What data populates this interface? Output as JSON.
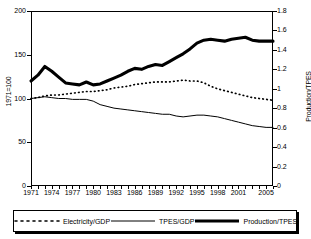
{
  "chart_data": {
    "type": "line",
    "title": "",
    "xlabel": "",
    "ylabel": "1971=100",
    "ylabel_right": "Production/TPES",
    "x": [
      1971,
      1972,
      1973,
      1974,
      1975,
      1976,
      1977,
      1978,
      1979,
      1980,
      1981,
      1982,
      1983,
      1984,
      1985,
      1986,
      1987,
      1988,
      1989,
      1990,
      1991,
      1992,
      1993,
      1994,
      1995,
      1996,
      1997,
      1998,
      1999,
      2000,
      2001,
      2002,
      2003,
      2004,
      2005,
      2006
    ],
    "xticks": [
      "1971",
      "1974",
      "1977",
      "1980",
      "1983",
      "1986",
      "1989",
      "1992",
      "1995",
      "1998",
      "2001",
      "2005"
    ],
    "yticks_left": [
      "0",
      "50",
      "100",
      "150",
      "200"
    ],
    "yticks_right": [
      "0",
      "0.2",
      "0.4",
      "0.6",
      "0.8",
      "1",
      "1.2",
      "1.4",
      "1.6",
      "1.8"
    ],
    "ylim_left": [
      0,
      200
    ],
    "ylim_right": [
      0,
      1.8
    ],
    "grid": false,
    "legend_position": "bottom",
    "series": [
      {
        "name": "Electricity/GDP",
        "axis": "left",
        "style": "dotted",
        "values": [
          100,
          101,
          103,
          104,
          104,
          105,
          106,
          107,
          108,
          108,
          109,
          110,
          112,
          113,
          114,
          116,
          117,
          118,
          119,
          119,
          119,
          120,
          121,
          120,
          120,
          118,
          114,
          111,
          109,
          107,
          105,
          103,
          101,
          100,
          99,
          98
        ]
      },
      {
        "name": "TPES/GDP",
        "axis": "left",
        "style": "thin-solid",
        "values": [
          100,
          101,
          102,
          101,
          100,
          100,
          99,
          99,
          99,
          97,
          93,
          91,
          89,
          88,
          87,
          86,
          85,
          84,
          83,
          82,
          82,
          80,
          79,
          80,
          81,
          81,
          80,
          79,
          77,
          75,
          73,
          71,
          69,
          68,
          67,
          67
        ]
      },
      {
        "name": "Production/TPES",
        "axis": "right",
        "style": "thick-solid",
        "values": [
          1.08,
          1.14,
          1.23,
          1.18,
          1.12,
          1.06,
          1.05,
          1.04,
          1.07,
          1.04,
          1.05,
          1.08,
          1.11,
          1.14,
          1.18,
          1.21,
          1.2,
          1.23,
          1.25,
          1.24,
          1.28,
          1.32,
          1.36,
          1.41,
          1.47,
          1.5,
          1.51,
          1.5,
          1.49,
          1.51,
          1.52,
          1.53,
          1.5,
          1.49,
          1.49,
          1.49
        ]
      }
    ]
  },
  "legend": {
    "items": [
      {
        "label": "Electricity/GDP",
        "style": "dotted"
      },
      {
        "label": "TPES/GDP",
        "style": "thin-solid"
      },
      {
        "label": "Production/TPES",
        "style": "thick-solid"
      }
    ]
  }
}
